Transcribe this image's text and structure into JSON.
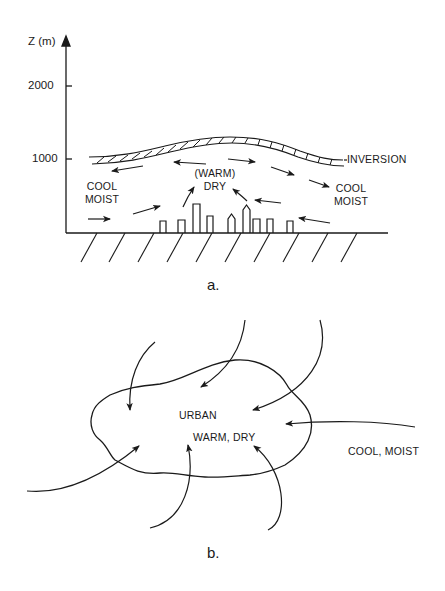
{
  "panel_a": {
    "axis_label": "Z (m)",
    "ticks": [
      "2000",
      "1000"
    ],
    "inversion_label": "INVERSION",
    "left_air_line1": "COOL",
    "left_air_line2": "MOIST",
    "center_air_line1": "(WARM)",
    "center_air_line2": "DRY",
    "right_air_line1": "COOL",
    "right_air_line2": "MOIST",
    "caption": "a."
  },
  "panel_b": {
    "urban_label": "URBAN",
    "urban_condition": "WARM, DRY",
    "outside_condition": "COOL, MOIST",
    "caption": "b."
  },
  "colors": {
    "ink": "#1a1a1a",
    "background": "#ffffff"
  }
}
